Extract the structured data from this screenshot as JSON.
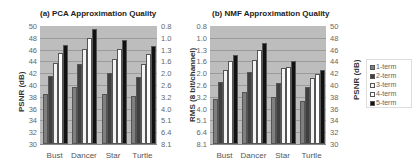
{
  "chart_data": [
    {
      "type": "bar",
      "title": "(a) PCA Approximation Quality",
      "categories": [
        "Bust",
        "Dancer",
        "Star",
        "Turtle"
      ],
      "ylabel": "PSNR (dB)",
      "ylabel_right": "RMS (8 bit/channel)",
      "ylim": [
        30,
        50
      ],
      "yticks_left": [
        "50",
        "48",
        "46",
        "44",
        "42",
        "40",
        "38",
        "36",
        "34",
        "32",
        "30"
      ],
      "yticks_right": [
        "0.8",
        "1.0",
        "1.3",
        "1.6",
        "2.0",
        "2.6",
        "3.2",
        "4.0",
        "5.1",
        "6.4",
        "8.1"
      ],
      "grid": true,
      "series": [
        {
          "name": "1-term",
          "values": [
            38.5,
            39.7,
            38.5,
            38.2
          ]
        },
        {
          "name": "2-term",
          "values": [
            41.6,
            43.5,
            42.0,
            41.4
          ]
        },
        {
          "name": "3-term",
          "values": [
            43.7,
            46.1,
            44.4,
            43.6
          ]
        },
        {
          "name": "4-term",
          "values": [
            45.5,
            48.0,
            46.1,
            45.3
          ]
        },
        {
          "name": "5-term",
          "values": [
            46.8,
            49.5,
            47.6,
            46.6
          ]
        }
      ]
    },
    {
      "type": "bar",
      "title": "(b) NMF Approximation Quality",
      "categories": [
        "Bust",
        "Dancer",
        "Star",
        "Turtle"
      ],
      "ylabel": "RMS (8 bit/channel)",
      "ylabel_right": "PSNR (dB)",
      "ylim": [
        30,
        50
      ],
      "yticks_left": [
        "0.8",
        "1.0",
        "1.3",
        "1.6",
        "2.0",
        "2.6",
        "3.2",
        "4.0",
        "5.1",
        "6.4",
        "8.1"
      ],
      "yticks_right": [
        "50",
        "48",
        "46",
        "44",
        "42",
        "40",
        "38",
        "36",
        "34",
        "32",
        "30"
      ],
      "grid": true,
      "series": [
        {
          "name": "1-term",
          "values": [
            37.6,
            38.8,
            38.0,
            37.3
          ]
        },
        {
          "name": "2-term",
          "values": [
            40.5,
            42.2,
            40.4,
            39.6
          ]
        },
        {
          "name": "3-term",
          "values": [
            42.5,
            44.3,
            42.8,
            41.2
          ]
        },
        {
          "name": "4-term",
          "values": [
            44.1,
            46.0,
            43.1,
            41.9
          ]
        },
        {
          "name": "5-term",
          "values": [
            45.1,
            47.1,
            44.1,
            42.6
          ]
        }
      ]
    }
  ],
  "legend": {
    "position": "right",
    "items": [
      {
        "label": "1-term",
        "color": "#7f7f7f"
      },
      {
        "label": "2-term",
        "color": "#3f3f3f"
      },
      {
        "label": "3-term",
        "color": "#f4f4f4"
      },
      {
        "label": "4-term",
        "color": "#ffffff"
      },
      {
        "label": "5-term",
        "color": "#111111"
      }
    ]
  },
  "colors": {
    "plot_background": "#bdbdbd",
    "gridline": "#9a9a9a"
  }
}
